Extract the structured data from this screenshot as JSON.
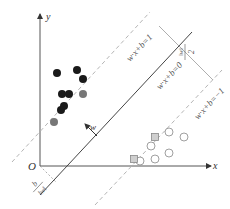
{
  "figure": {
    "axes": {
      "origin_label": "O",
      "x_label": "x",
      "y_label": "y",
      "axis_color": "#333333"
    },
    "lines": {
      "hyperplane": {
        "label": "w·x+b=0",
        "style": "solid",
        "color": "#333333"
      },
      "positive_margin": {
        "label": "w·x+b=1",
        "style": "dashed",
        "color": "#aaaaaa"
      },
      "negative_margin": {
        "label": "w·x+b=−1",
        "style": "dashed",
        "color": "#aaaaaa"
      }
    },
    "annotations": {
      "normal_vector": "w",
      "margin_width": {
        "numerator": "2",
        "denominator": "‖w‖"
      },
      "offset": {
        "numerator": "b",
        "denominator": "‖w‖"
      }
    },
    "class_positive": {
      "marker": "filled-circle",
      "color": "#1a1a1a",
      "points": [
        [
          57,
          73
        ],
        [
          77,
          70
        ],
        [
          83,
          79
        ],
        [
          62,
          94
        ],
        [
          69,
          94
        ],
        [
          61,
          110
        ],
        [
          64,
          106
        ]
      ]
    },
    "class_positive_support": {
      "marker": "filled-circle",
      "color": "#777777",
      "points": [
        [
          83,
          94
        ],
        [
          54,
          122
        ]
      ]
    },
    "class_negative": {
      "marker": "hollow-circle",
      "color": "#888888",
      "points": [
        [
          169,
          132
        ],
        [
          184,
          137
        ],
        [
          151,
          146
        ],
        [
          169,
          153
        ],
        [
          155,
          159
        ],
        [
          140,
          161
        ]
      ]
    },
    "class_negative_support": {
      "marker": "hollow-square",
      "color": "#888888",
      "points": [
        [
          155,
          137
        ],
        [
          134,
          159
        ]
      ]
    }
  }
}
